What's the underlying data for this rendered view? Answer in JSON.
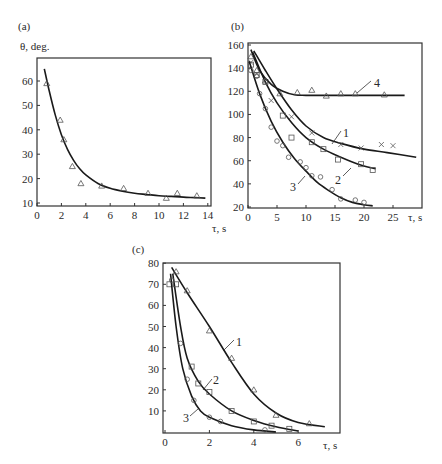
{
  "chart_data": [
    {
      "panel": "(a)",
      "type": "scatter",
      "title": "",
      "xlabel": "τ, s",
      "ylabel": "θ, deg.",
      "xlim": [
        0,
        14
      ],
      "ylim": [
        10,
        70
      ],
      "xticks": [
        0,
        2,
        4,
        6,
        8,
        10,
        12,
        14
      ],
      "yticks": [
        10,
        20,
        30,
        40,
        50,
        60
      ],
      "grid": false,
      "series": [
        {
          "name": "data",
          "marker": "triangle",
          "x": [
            0.8,
            1.9,
            2.2,
            2.9,
            3.6,
            5.3,
            7.1,
            9.1,
            10.6,
            11.5,
            13.1
          ],
          "y": [
            59,
            44,
            36,
            25,
            18,
            17,
            16,
            14,
            12,
            14,
            13
          ]
        },
        {
          "name": "fit",
          "style": "line",
          "x": [
            0.6,
            1.0,
            1.5,
            2.0,
            2.5,
            3.0,
            3.5,
            4.0,
            5.0,
            6.0,
            7.0,
            8.0,
            9.0,
            10.0,
            11.0,
            12.0,
            13.0,
            13.8
          ],
          "y": [
            65,
            56,
            46,
            38,
            32,
            27.5,
            24,
            21.5,
            18,
            16,
            14.8,
            14,
            13.5,
            13,
            12.7,
            12.4,
            12.2,
            12
          ]
        }
      ]
    },
    {
      "panel": "(b)",
      "type": "scatter",
      "title": "",
      "xlabel": "τ, s",
      "ylabel": "",
      "xlim": [
        0,
        30
      ],
      "ylim": [
        20,
        160
      ],
      "xticks": [
        0,
        5,
        10,
        15,
        20,
        25
      ],
      "yticks": [
        20,
        40,
        60,
        80,
        100,
        120,
        140,
        160
      ],
      "grid": false,
      "series": [
        {
          "name": "1",
          "marker": "cross",
          "x": [
            0.5,
            1.5,
            4,
            7.5,
            11,
            16,
            19.5,
            23,
            25
          ],
          "y": [
            145,
            135,
            112,
            98,
            84,
            74,
            71,
            74,
            73
          ],
          "fit_x": [
            1,
            3,
            5,
            7.5,
            10,
            13,
            16,
            20,
            24,
            29
          ],
          "fit_y": [
            155,
            138,
            122,
            104,
            90,
            80,
            75,
            70,
            67,
            63
          ]
        },
        {
          "name": "2",
          "marker": "square",
          "x": [
            0.5,
            1.5,
            3,
            6,
            7.5,
            11,
            13,
            15.5,
            19.5,
            21.5
          ],
          "y": [
            143,
            134,
            128,
            99,
            80,
            76,
            70,
            61,
            57,
            52
          ],
          "fit_x": [
            0.8,
            3,
            5,
            7.5,
            10,
            13,
            16,
            19,
            22
          ],
          "fit_y": [
            154,
            128,
            110,
            93,
            80,
            70,
            63,
            57,
            53
          ]
        },
        {
          "name": "3",
          "marker": "circle",
          "x": [
            0.5,
            1.5,
            2,
            3,
            4,
            5,
            6,
            7,
            9,
            10,
            11,
            12.5,
            14.5,
            16,
            18.5,
            20
          ],
          "y": [
            138,
            133,
            118,
            105,
            89,
            77,
            73,
            63,
            59,
            54,
            47,
            46,
            35,
            27,
            26,
            24
          ],
          "fit_x": [
            0.2,
            2,
            4,
            6,
            8,
            10,
            12,
            14,
            16,
            18,
            20,
            21.5
          ],
          "fit_y": [
            146,
            118,
            94,
            76,
            62,
            51,
            41,
            34,
            28,
            24,
            22,
            21
          ]
        },
        {
          "name": "4",
          "marker": "triangle",
          "x": [
            0.5,
            1.5,
            3,
            5.5,
            8.5,
            11,
            13.5,
            16,
            18.5,
            23.5
          ],
          "y": [
            150,
            138,
            129,
            118,
            119,
            121,
            116,
            118,
            118,
            117
          ],
          "fit_x": [
            0.5,
            2,
            4,
            6,
            8,
            10,
            15,
            20,
            27
          ],
          "fit_y": [
            156,
            138,
            126,
            120,
            117,
            116.5,
            116.5,
            116.5,
            116.5
          ]
        }
      ]
    },
    {
      "panel": "(c)",
      "type": "scatter",
      "title": "",
      "xlabel": "τ, s",
      "ylabel": "",
      "xlim": [
        0,
        7.5
      ],
      "ylim": [
        0,
        80
      ],
      "xticks": [
        0,
        2,
        4,
        6
      ],
      "yticks": [
        10,
        20,
        30,
        40,
        50,
        60,
        70,
        80
      ],
      "grid": false,
      "series": [
        {
          "name": "1",
          "marker": "triangle",
          "x": [
            0.5,
            1.0,
            2.0,
            3.0,
            4.0,
            5.0,
            6.5
          ],
          "y": [
            76,
            67,
            48,
            35,
            20,
            8,
            4
          ],
          "fit_x": [
            0.3,
            1,
            2,
            3,
            4,
            5,
            6,
            7.2
          ],
          "fit_y": [
            78,
            66,
            50,
            33,
            18,
            9,
            4.5,
            2.5
          ]
        },
        {
          "name": "2",
          "marker": "square",
          "x": [
            0.2,
            0.5,
            1.2,
            1.5,
            2.0,
            3.0,
            4.0,
            4.8,
            5.6
          ],
          "y": [
            70,
            70,
            31,
            23,
            19,
            10,
            5,
            3,
            1.5
          ],
          "fit_x": [
            0.35,
            0.7,
            1,
            1.5,
            2,
            3,
            4,
            5,
            6
          ],
          "fit_y": [
            75,
            50,
            35,
            24,
            18,
            10,
            5.5,
            2.5,
            0.5
          ]
        },
        {
          "name": "3",
          "marker": "circle",
          "x": [
            0.3,
            0.7,
            1.0,
            1.3,
            2.0,
            2.5,
            4.5
          ],
          "y": [
            72,
            42,
            25,
            15,
            7,
            5,
            1
          ],
          "fit_x": [
            0.25,
            0.5,
            0.8,
            1.2,
            1.6,
            2,
            3,
            4,
            5
          ],
          "fit_y": [
            75,
            50,
            30,
            17,
            10,
            7,
            3,
            1,
            0
          ]
        }
      ]
    }
  ],
  "labels": {
    "panel_a": "(a)",
    "panel_b": "(b)",
    "panel_c": "(c)",
    "a_ylabel": "θ, deg.",
    "a_xlabel": "τ, s",
    "b_xlabel": "τ, s",
    "c_xlabel": "τ, s",
    "curve_1": "1",
    "curve_2": "2",
    "curve_3": "3",
    "curve_4": "4"
  }
}
